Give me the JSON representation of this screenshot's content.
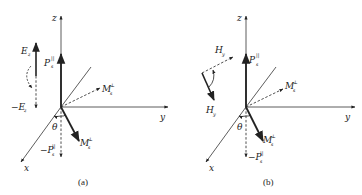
{
  "figure": {
    "panels": [
      {
        "id": "a",
        "caption": "(a)",
        "axes": {
          "z": "z",
          "y": "y",
          "x": "x"
        },
        "angle_label": "θ",
        "vectors": {
          "p_par": {
            "main": "P",
            "sup": "||",
            "sub": "s"
          },
          "neg_p_par": {
            "main": "−P",
            "sup": "||",
            "sub": "s"
          },
          "m_perp_solid": {
            "main": "M",
            "sup": "⊥",
            "sub": "s"
          },
          "m_perp_dashed": {
            "main": "M",
            "sup": "⊥",
            "sub": "s"
          }
        },
        "field": {
          "pos": "E",
          "pos_sub": "z",
          "neg": "−E",
          "neg_sub": "z"
        }
      },
      {
        "id": "b",
        "caption": "(b)",
        "axes": {
          "z": "z",
          "y": "y",
          "x": "x"
        },
        "angle_label": "θ",
        "vectors": {
          "p_par": {
            "main": "P",
            "sup": "||",
            "sub": "s"
          },
          "neg_p_par": {
            "main": "−P",
            "sup": "||",
            "sub": "s"
          },
          "m_perp_solid": {
            "main": "M",
            "sup": "⊥",
            "sub": "s"
          },
          "m_perp_dashed": {
            "main": "M",
            "sup": "⊥",
            "sub": "s"
          }
        },
        "field": {
          "top": "H",
          "top_sub": "y",
          "bottom": "H",
          "bottom_sub": "y"
        }
      }
    ]
  }
}
